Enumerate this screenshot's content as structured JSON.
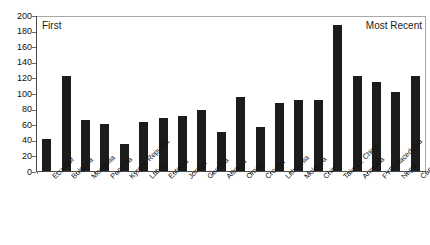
{
  "chart_data": {
    "type": "bar",
    "title": "",
    "subtitle": "",
    "xlabel": "",
    "ylabel": "",
    "ylim": [
      0,
      200
    ],
    "ytick_step": 20,
    "yticks": [
      200,
      180,
      160,
      140,
      120,
      100,
      80,
      60,
      40,
      20,
      0
    ],
    "grid": false,
    "legend": "none",
    "bar_color": "#1c1c1c",
    "frame_color": "#a8a8a8",
    "annotations": [
      {
        "text": "First",
        "position": "top-left-inside"
      },
      {
        "text": "Most Recent",
        "position": "top-right-inside"
      }
    ],
    "categories": [
      "Ecuador",
      "Bulgaria",
      "Mongolia",
      "Panama",
      "Kyrgyz Republic",
      "Latvia",
      "Estonia",
      "Jordan",
      "Georgia",
      "Albania",
      "Oman",
      "Croatia",
      "Lithuania",
      "Moldova",
      "China",
      "Taiwan, China",
      "Armenia",
      "FYR Macedonia",
      "Nepal",
      "Cambodia"
    ],
    "values": [
      41,
      123,
      66,
      61,
      35,
      64,
      69,
      71,
      79,
      51,
      96,
      57,
      88,
      92,
      92,
      190,
      124,
      116,
      102,
      123
    ]
  }
}
